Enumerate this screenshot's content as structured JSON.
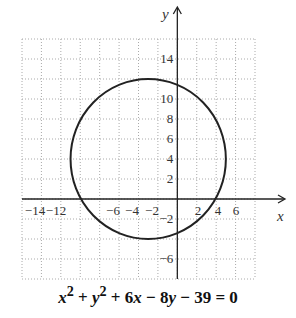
{
  "chart_data": {
    "type": "line",
    "subtype": "circle-graph",
    "title": "",
    "equation": "x^2 + y^2 + 6x - 8y - 39 = 0",
    "circle": {
      "center": [
        -3,
        4
      ],
      "radius": 8
    },
    "xlabel": "x",
    "ylabel": "y",
    "xlim": [
      -16,
      8
    ],
    "ylim": [
      -8,
      16
    ],
    "grid": true,
    "grid_step": 2,
    "x_tick_labels": [
      "-14",
      "-12",
      "-6",
      "-4",
      "-2",
      "2",
      "4",
      "6"
    ],
    "y_tick_labels": [
      "14",
      "10",
      "8",
      "6",
      "4",
      "2",
      "-2",
      "-6"
    ],
    "legend": null
  },
  "equation_parts": {
    "x": "x",
    "sup1": "2",
    "plus1": " + ",
    "y": "y",
    "sup2": "2",
    "rest_a": " + 6",
    "x2": "x",
    "rest_b": " − 8",
    "y2": "y",
    "rest_c": " − 39 = 0"
  }
}
